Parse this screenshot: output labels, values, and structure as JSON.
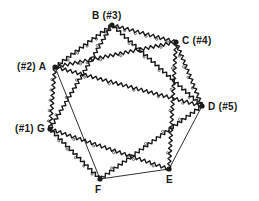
{
  "diagram": {
    "title": "",
    "colors": {
      "line": "#1a1a1a",
      "background": "#ffffff"
    },
    "nodes": [
      {
        "id": "A",
        "label": "(#2) A",
        "x": 55,
        "y": 67,
        "label_x": 17,
        "label_y": 62
      },
      {
        "id": "B",
        "label": "B (#3)",
        "x": 112,
        "y": 25,
        "label_x": 92,
        "label_y": 11
      },
      {
        "id": "C",
        "label": "C (#4)",
        "x": 176,
        "y": 42,
        "label_x": 182,
        "label_y": 36
      },
      {
        "id": "D",
        "label": "D (#5)",
        "x": 202,
        "y": 106,
        "label_x": 208,
        "label_y": 102
      },
      {
        "id": "G",
        "label": "(#1) G",
        "x": 50,
        "y": 129,
        "label_x": 15,
        "label_y": 124
      },
      {
        "id": "F",
        "label": "F",
        "x": 100,
        "y": 179,
        "label_x": 95,
        "label_y": 185
      },
      {
        "id": "E",
        "label": "E",
        "x": 169,
        "y": 169,
        "label_x": 166,
        "label_y": 175
      }
    ],
    "edges": [
      {
        "from": "A",
        "to": "B",
        "style": "wavy"
      },
      {
        "from": "B",
        "to": "C",
        "style": "wavy"
      },
      {
        "from": "C",
        "to": "D",
        "style": "wavy"
      },
      {
        "from": "A",
        "to": "G",
        "style": "wavy"
      },
      {
        "from": "G",
        "to": "F",
        "style": "wavy"
      },
      {
        "from": "A",
        "to": "C",
        "style": "wavy"
      },
      {
        "from": "A",
        "to": "D",
        "style": "wavy"
      },
      {
        "from": "B",
        "to": "G",
        "style": "wavy"
      },
      {
        "from": "B",
        "to": "D",
        "style": "wavy"
      },
      {
        "from": "C",
        "to": "E",
        "style": "wavy"
      },
      {
        "from": "G",
        "to": "E",
        "style": "wavy"
      },
      {
        "from": "D",
        "to": "F",
        "style": "wavy"
      },
      {
        "from": "A",
        "to": "F",
        "style": "straight"
      },
      {
        "from": "F",
        "to": "E",
        "style": "straight"
      },
      {
        "from": "E",
        "to": "D",
        "style": "straight"
      }
    ]
  }
}
